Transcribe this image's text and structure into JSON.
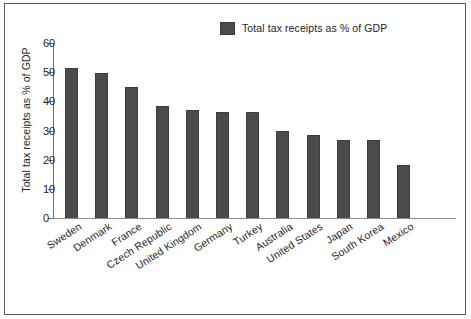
{
  "chart_data": {
    "type": "bar",
    "title": "",
    "xlabel": "",
    "ylabel": "Total tax receipts as % of GDP",
    "ylim": [
      0,
      60
    ],
    "yticks": [
      0,
      10,
      20,
      30,
      40,
      50,
      60
    ],
    "grid": false,
    "legend": {
      "position": "top-right",
      "entries": [
        "Total tax receipts as % of GDP"
      ]
    },
    "series_name": "Total tax receipts as % of GDP",
    "bar_color": "#4b4b4b",
    "categories": [
      "Sweden",
      "Denmark",
      "France",
      "Czech Republic",
      "United Kingdom",
      "Germany",
      "Turkey",
      "Australia",
      "United States",
      "Japan",
      "South Korea",
      "Mexico"
    ],
    "values": [
      51.4,
      49.8,
      45.0,
      38.4,
      37.2,
      36.5,
      36.2,
      29.8,
      28.5,
      26.8,
      26.6,
      18.3
    ]
  },
  "figure": {
    "background": "#ffffff",
    "frame_color": "#5a5a5a"
  }
}
